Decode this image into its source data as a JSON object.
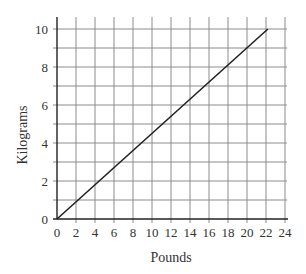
{
  "chart_data": {
    "type": "line",
    "title": "",
    "xlabel": "Pounds",
    "ylabel": "Kilograms",
    "xlim": [
      0,
      24
    ],
    "ylim": [
      0,
      10
    ],
    "x_ticks": [
      0,
      2,
      4,
      6,
      8,
      10,
      12,
      14,
      16,
      18,
      20,
      22,
      24
    ],
    "y_ticks": [
      0,
      2,
      4,
      6,
      8,
      10
    ],
    "grid": true,
    "grid_x_step": 2,
    "grid_y_step": 1,
    "legend": null,
    "series": [
      {
        "name": "Kilograms vs Pounds",
        "color": "#222222",
        "x": [
          0,
          22.2
        ],
        "y": [
          0,
          10
        ]
      }
    ]
  },
  "labels": {
    "xlabel": "Pounds",
    "ylabel": "Kilograms"
  }
}
